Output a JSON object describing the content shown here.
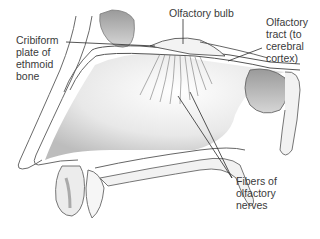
{
  "diagram": {
    "labels": [
      {
        "id": "cribriform",
        "text": "Cribiform\nplate of\nethmoid\nbone"
      },
      {
        "id": "bulb",
        "text": "Olfactory bulb"
      },
      {
        "id": "tract",
        "text": "Olfactory\ntract (to\ncerebral\ncortex)"
      },
      {
        "id": "fibers",
        "text": "Fibers of\nolfactory\nnerves"
      }
    ],
    "colors": {
      "line": "#2b2b2b",
      "bone_fill": "#efefef",
      "shade": "#bdbdbd",
      "background": "#ffffff"
    }
  }
}
